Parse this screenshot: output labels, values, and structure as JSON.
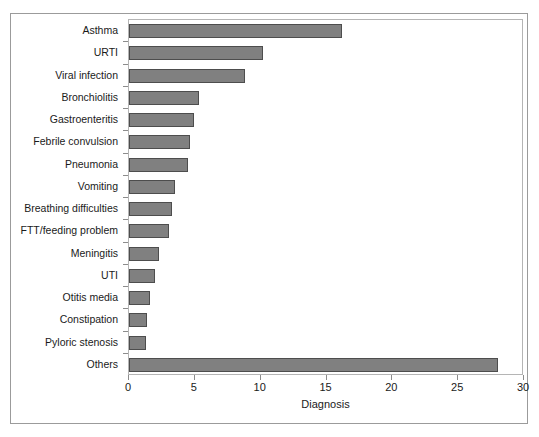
{
  "chart_data": {
    "type": "bar",
    "orientation": "horizontal",
    "title": "",
    "xlabel": "Diagnosis",
    "ylabel": "",
    "xlim": [
      0,
      30
    ],
    "xticks": [
      0,
      5,
      10,
      15,
      20,
      25,
      30
    ],
    "xtick_labels": [
      "0",
      "5",
      "10",
      "15",
      "20",
      "25",
      "30"
    ],
    "grid": false,
    "legend": null,
    "bar_color": "#808080",
    "bar_edge_color": "#4d4d4d",
    "categories": [
      "Asthma",
      "URTI",
      "Viral infection",
      "Bronchiolitis",
      "Gastroenteritis",
      "Febrile convulsion",
      "Pneumonia",
      "Vomiting",
      "Breathing difficulties",
      "FTT/feeding problem",
      "Meningitis",
      "UTI",
      "Otitis media",
      "Constipation",
      "Pyloric stenosis",
      "Others"
    ],
    "values": [
      16.2,
      10.2,
      8.8,
      5.3,
      4.9,
      4.6,
      4.5,
      3.5,
      3.3,
      3.0,
      2.3,
      2.0,
      1.6,
      1.4,
      1.3,
      28.0
    ]
  },
  "axis": {
    "x_title": "Diagnosis"
  },
  "caption": ""
}
